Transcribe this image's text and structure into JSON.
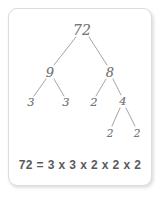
{
  "card": {
    "title": "factor-tree-card",
    "border_color": "#dcdcdc",
    "background": "#ffffff"
  },
  "diagram": {
    "type": "factor-tree",
    "ink_color": "#77777a",
    "line_color": "#9a9a9d",
    "nodes": [
      {
        "id": "root",
        "label": "72",
        "x": 82,
        "y": 30,
        "level": 0
      },
      {
        "id": "l1a",
        "label": "9",
        "x": 50,
        "y": 72,
        "level": 1
      },
      {
        "id": "l1b",
        "label": "8",
        "x": 110,
        "y": 72,
        "level": 1
      },
      {
        "id": "l2a",
        "label": "3",
        "x": 31,
        "y": 103,
        "level": 2
      },
      {
        "id": "l2b",
        "label": "3",
        "x": 66,
        "y": 103,
        "level": 2
      },
      {
        "id": "l2c",
        "label": "2",
        "x": 94,
        "y": 103,
        "level": 2
      },
      {
        "id": "l2d",
        "label": "4",
        "x": 123,
        "y": 102,
        "level": 2
      },
      {
        "id": "l3a",
        "label": "2",
        "x": 110,
        "y": 133,
        "level": 3
      },
      {
        "id": "l3b",
        "label": "2",
        "x": 137,
        "y": 133,
        "level": 3
      }
    ],
    "edges": [
      {
        "from": "root",
        "to": "l1a",
        "x1": 76,
        "y1": 37,
        "x2": 54,
        "y2": 65
      },
      {
        "from": "root",
        "to": "l1b",
        "x1": 89,
        "y1": 37,
        "x2": 107,
        "y2": 65
      },
      {
        "from": "l1a",
        "to": "l2a",
        "x1": 46,
        "y1": 79,
        "x2": 34,
        "y2": 96
      },
      {
        "from": "l1a",
        "to": "l2b",
        "x1": 54,
        "y1": 79,
        "x2": 64,
        "y2": 96
      },
      {
        "from": "l1b",
        "to": "l2c",
        "x1": 106,
        "y1": 79,
        "x2": 96,
        "y2": 96
      },
      {
        "from": "l1b",
        "to": "l2d",
        "x1": 113,
        "y1": 79,
        "x2": 121,
        "y2": 95
      },
      {
        "from": "l2d",
        "to": "l3a",
        "x1": 120,
        "y1": 108,
        "x2": 112,
        "y2": 126
      },
      {
        "from": "l2d",
        "to": "l3b",
        "x1": 126,
        "y1": 108,
        "x2": 135,
        "y2": 126
      }
    ]
  },
  "equation": {
    "text": "72 = 3 x 3 x 2 x 2 x 2",
    "left": "72",
    "factors": [
      "3",
      "3",
      "2",
      "2",
      "2"
    ],
    "operator": "x"
  }
}
